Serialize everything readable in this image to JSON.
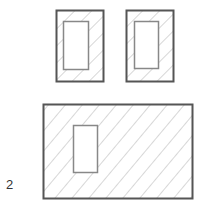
{
  "diagram": {
    "colors": {
      "outline": "#555555",
      "inner_outline": "#888888",
      "hatch": "#aaaaaa",
      "background": "#ffffff"
    },
    "shapes": [
      {
        "name": "small-hatched-block-left",
        "type": "hatched-rectangle-with-hole"
      },
      {
        "name": "small-hatched-block-right",
        "type": "hatched-rectangle-with-hole"
      },
      {
        "name": "large-hatched-block",
        "type": "hatched-rectangle-with-hole"
      }
    ],
    "labels": [
      {
        "name": "figure-label-2",
        "text": "2"
      }
    ]
  }
}
